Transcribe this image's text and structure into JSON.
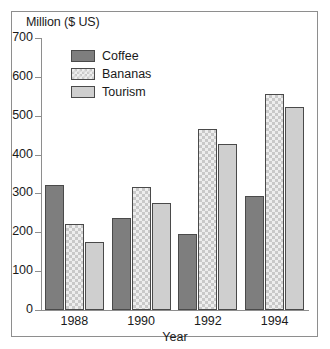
{
  "chart_data": {
    "type": "bar",
    "title": "",
    "ylabel": "Million ($ US)",
    "xlabel": "Year",
    "categories": [
      "1988",
      "1990",
      "1992",
      "1994"
    ],
    "series": [
      {
        "name": "Coffee",
        "color": "#7e7e7e",
        "pattern": "solid-dark-gray",
        "values": [
          322,
          237,
          196,
          294
        ]
      },
      {
        "name": "Bananas",
        "color": "#eeeeee",
        "pattern": "checkered",
        "values": [
          221,
          317,
          467,
          557
        ]
      },
      {
        "name": "Tourism",
        "color": "#cfcfcf",
        "pattern": "solid-light-gray",
        "values": [
          176,
          276,
          428,
          523
        ]
      }
    ],
    "ylim": [
      0,
      700
    ],
    "ytick_labels": [
      "700",
      "600",
      "500",
      "400",
      "300",
      "200",
      "100",
      "0"
    ],
    "ytick_values": [
      700,
      600,
      500,
      400,
      300,
      200,
      100,
      0
    ],
    "grid": false,
    "legend_position": "top-left-inside"
  },
  "legend": {
    "entries": [
      {
        "label": "Coffee"
      },
      {
        "label": "Bananas"
      },
      {
        "label": "Tourism"
      }
    ]
  }
}
